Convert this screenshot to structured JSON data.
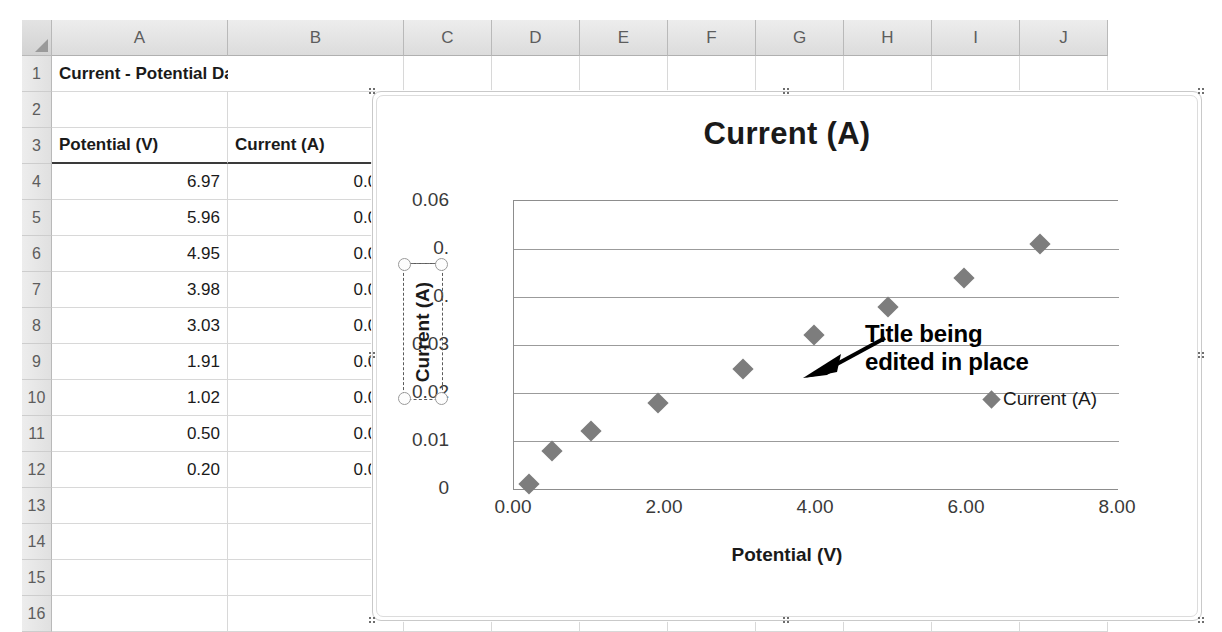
{
  "spreadsheet": {
    "columns": [
      "A",
      "B",
      "C",
      "D",
      "E",
      "F",
      "G",
      "H",
      "I",
      "J"
    ],
    "rows": [
      "1",
      "2",
      "3",
      "4",
      "5",
      "6",
      "7",
      "8",
      "9",
      "10",
      "11",
      "12",
      "13",
      "14",
      "15",
      "16"
    ],
    "title_cell": "Current - Potential Data",
    "headers": {
      "a": "Potential (V)",
      "b": "Current (A)"
    },
    "data": [
      {
        "potential": "6.97",
        "current": "0.051"
      },
      {
        "potential": "5.96",
        "current": "0.044"
      },
      {
        "potential": "4.95",
        "current": "0.038"
      },
      {
        "potential": "3.98",
        "current": "0.032"
      },
      {
        "potential": "3.03",
        "current": "0.025"
      },
      {
        "potential": "1.91",
        "current": "0.018"
      },
      {
        "potential": "1.02",
        "current": "0.012"
      },
      {
        "potential": "0.50",
        "current": "0.008"
      },
      {
        "potential": "0.20",
        "current": "0.001"
      }
    ]
  },
  "annotation": {
    "line1": "Title being",
    "line2": "edited in place"
  },
  "chart_data": {
    "type": "scatter",
    "title": "Current (A)",
    "xlabel": "Potential (V)",
    "ylabel": "Current (A)",
    "ylabel_editing": true,
    "legend": [
      "Current (A)"
    ],
    "legend_position": "right",
    "grid": true,
    "xlim": [
      0,
      8
    ],
    "ylim": [
      0,
      0.06
    ],
    "xticks": [
      "0.00",
      "2.00",
      "4.00",
      "6.00",
      "8.00"
    ],
    "yticks": [
      "0.06",
      "0.05",
      "0.04",
      "0.03",
      "0.02",
      "0.01",
      "0"
    ],
    "ytick_occluded": [
      "0.",
      "0."
    ],
    "series": [
      {
        "name": "Current (A)",
        "marker": "diamond",
        "color": "#7d7d7d",
        "x": [
          6.97,
          5.96,
          4.95,
          3.98,
          3.03,
          1.91,
          1.02,
          0.5,
          0.2
        ],
        "y": [
          0.051,
          0.044,
          0.038,
          0.032,
          0.025,
          0.018,
          0.012,
          0.008,
          0.001
        ]
      }
    ]
  }
}
